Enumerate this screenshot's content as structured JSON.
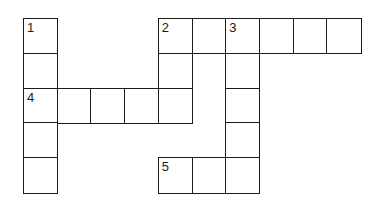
{
  "puzzle": {
    "type": "crossword",
    "rows": 5,
    "cols": 10,
    "clue_numbers": [
      "1",
      "2",
      "3",
      "4",
      "5"
    ],
    "entries": [
      {
        "number": "1",
        "direction": "down",
        "row": 0,
        "col": 0,
        "length": 5
      },
      {
        "number": "2",
        "direction": "across",
        "row": 0,
        "col": 4,
        "length": 6
      },
      {
        "number": "2",
        "direction": "down",
        "row": 0,
        "col": 4,
        "length": 3
      },
      {
        "number": "3",
        "direction": "down",
        "row": 0,
        "col": 6,
        "length": 5
      },
      {
        "number": "4",
        "direction": "across",
        "row": 2,
        "col": 0,
        "length": 5
      },
      {
        "number": "5",
        "direction": "across",
        "row": 4,
        "col": 4,
        "length": 3
      }
    ],
    "cells": [
      {
        "r": 0,
        "c": 0,
        "num": "1"
      },
      {
        "r": 1,
        "c": 0,
        "num": ""
      },
      {
        "r": 2,
        "c": 0,
        "num": "4"
      },
      {
        "r": 3,
        "c": 0,
        "num": ""
      },
      {
        "r": 4,
        "c": 0,
        "num": ""
      },
      {
        "r": 2,
        "c": 1,
        "num": ""
      },
      {
        "r": 2,
        "c": 2,
        "num": ""
      },
      {
        "r": 2,
        "c": 3,
        "num": ""
      },
      {
        "r": 0,
        "c": 4,
        "num": "2"
      },
      {
        "r": 1,
        "c": 4,
        "num": ""
      },
      {
        "r": 2,
        "c": 4,
        "num": ""
      },
      {
        "r": 0,
        "c": 5,
        "num": ""
      },
      {
        "r": 0,
        "c": 6,
        "num": "3"
      },
      {
        "r": 1,
        "c": 6,
        "num": ""
      },
      {
        "r": 2,
        "c": 6,
        "num": ""
      },
      {
        "r": 3,
        "c": 6,
        "num": ""
      },
      {
        "r": 0,
        "c": 7,
        "num": ""
      },
      {
        "r": 0,
        "c": 8,
        "num": ""
      },
      {
        "r": 0,
        "c": 9,
        "num": ""
      },
      {
        "r": 4,
        "c": 4,
        "num": "5"
      },
      {
        "r": 4,
        "c": 5,
        "num": ""
      },
      {
        "r": 4,
        "c": 6,
        "num": ""
      }
    ]
  },
  "colors": {
    "line": "#1a1a1a",
    "background": "#ffffff"
  }
}
